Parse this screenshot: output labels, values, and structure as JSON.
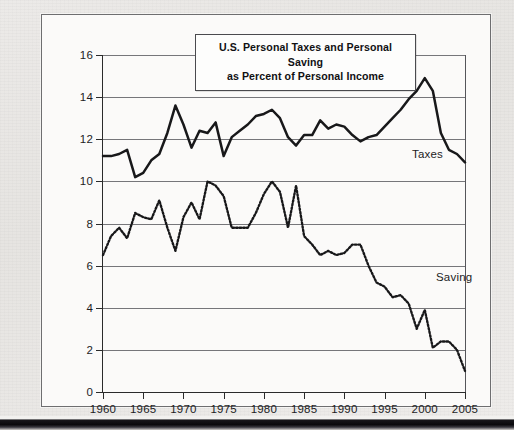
{
  "figure": {
    "title_line1": "U.S. Personal Taxes and Personal Saving",
    "title_line2": "as Percent of Personal Income",
    "taxes_label": "Taxes",
    "saving_label": "Saving"
  },
  "chart_data": {
    "type": "line",
    "title": "U.S. Personal Taxes and Personal Saving as Percent of Personal Income",
    "xlabel": "",
    "ylabel": "",
    "xlim": [
      1960,
      2005
    ],
    "ylim": [
      0,
      16
    ],
    "grid": true,
    "legend_position": "inline-annotation",
    "ytick_labels": [
      "0",
      "2",
      "4",
      "6",
      "8",
      "10",
      "12",
      "14",
      "16"
    ],
    "yticks": [
      0,
      2,
      4,
      6,
      8,
      10,
      12,
      14,
      16
    ],
    "xtick_labels": [
      "1960",
      "1965",
      "1970",
      "1975",
      "1980",
      "1985",
      "1990",
      "1995",
      "2000",
      "2005"
    ],
    "xticks": [
      1960,
      1965,
      1970,
      1975,
      1980,
      1985,
      1990,
      1995,
      2000,
      2005
    ],
    "x": [
      1960,
      1961,
      1962,
      1963,
      1964,
      1965,
      1966,
      1967,
      1968,
      1969,
      1970,
      1971,
      1972,
      1973,
      1974,
      1975,
      1976,
      1977,
      1978,
      1979,
      1980,
      1981,
      1982,
      1983,
      1984,
      1985,
      1986,
      1987,
      1988,
      1989,
      1990,
      1991,
      1992,
      1993,
      1994,
      1995,
      1996,
      1997,
      1998,
      1999,
      2000,
      2001,
      2002,
      2003,
      2004,
      2005
    ],
    "series": [
      {
        "name": "Taxes",
        "style": "solid",
        "values": [
          11.2,
          11.2,
          11.3,
          11.5,
          10.2,
          10.4,
          11.0,
          11.3,
          12.3,
          13.6,
          12.7,
          11.6,
          12.4,
          12.3,
          12.8,
          11.2,
          12.1,
          12.4,
          12.7,
          13.1,
          13.2,
          13.4,
          13.0,
          12.1,
          11.7,
          12.2,
          12.2,
          12.9,
          12.5,
          12.7,
          12.6,
          12.2,
          11.9,
          12.1,
          12.2,
          12.6,
          13.0,
          13.4,
          13.9,
          14.3,
          14.9,
          14.3,
          12.3,
          11.5,
          11.3,
          10.9
        ]
      },
      {
        "name": "Saving",
        "style": "dotted",
        "values": [
          6.5,
          7.4,
          7.8,
          7.3,
          8.5,
          8.3,
          8.2,
          9.1,
          7.8,
          6.7,
          8.3,
          9.0,
          8.2,
          10.0,
          9.8,
          9.3,
          7.8,
          7.8,
          7.8,
          8.5,
          9.4,
          10.0,
          9.5,
          7.8,
          9.8,
          7.4,
          7.0,
          6.5,
          6.7,
          6.5,
          6.6,
          7.0,
          7.0,
          6.0,
          5.2,
          5.0,
          4.5,
          4.6,
          4.2,
          3.0,
          3.9,
          2.1,
          2.4,
          2.4,
          2.0,
          1.0
        ]
      }
    ]
  }
}
